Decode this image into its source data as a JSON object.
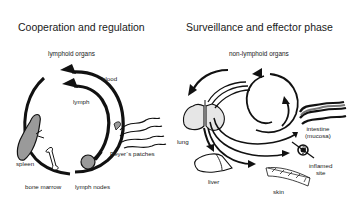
{
  "left_panel": {
    "title": "Cooperation and regulation",
    "subtitle": "lymphoid organs",
    "labels": {
      "blood": "blood",
      "lymph": "lymph",
      "spleen": "spleen",
      "bone_marrow": "bone marrow",
      "lymph_nodes": "lymph nodes",
      "peyers_patches": "Peyer´s patches"
    }
  },
  "right_panel": {
    "title": "Surveillance and effector phase",
    "subtitle": "non-lymphoid organs",
    "labels": {
      "lung": "lung",
      "liver": "liver",
      "skin": "skin",
      "intestine_line1": "intestine",
      "intestine_line2": "(mucosa)",
      "inflamed_line1": "inflamed",
      "inflamed_line2": "site"
    }
  },
  "colors": {
    "stroke": "#111111",
    "organ_fill": "#9a9a9a",
    "light_fill": "#e6e6e6",
    "background": "#ffffff"
  }
}
